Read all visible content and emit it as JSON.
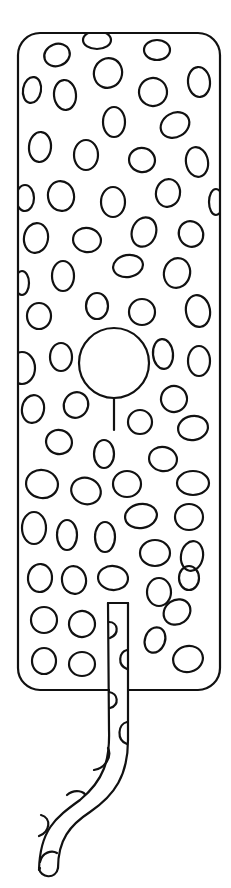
{
  "drawing": {
    "title": "Giraffe-pattern body with tail (line art)",
    "colors": {
      "ink": "#111111",
      "paper": "#ffffff"
    },
    "body": {
      "x": 18,
      "y": 33,
      "width": 202,
      "height": 657,
      "corner_radius": 22
    },
    "center_circle": {
      "cx": 114,
      "cy": 363,
      "r": 35,
      "stem": {
        "x": 114,
        "y1": 398,
        "y2": 430
      }
    },
    "spots": [
      [
        57,
        55,
        13,
        11,
        -20
      ],
      [
        97,
        40,
        14,
        9,
        0
      ],
      [
        157,
        50,
        13,
        10,
        0
      ],
      [
        32,
        90,
        9,
        13,
        10
      ],
      [
        65,
        95,
        11,
        15,
        -5
      ],
      [
        108,
        73,
        14,
        15,
        20
      ],
      [
        153,
        92,
        14,
        14,
        30
      ],
      [
        199,
        82,
        11,
        15,
        -5
      ],
      [
        40,
        147,
        11,
        15,
        5
      ],
      [
        114,
        122,
        11,
        15,
        0
      ],
      [
        175,
        125,
        15,
        12,
        -30
      ],
      [
        86,
        155,
        12,
        15,
        0
      ],
      [
        142,
        160,
        13,
        12,
        10
      ],
      [
        197,
        162,
        11,
        15,
        -10
      ],
      [
        25,
        198,
        9,
        13,
        0
      ],
      [
        61,
        196,
        13,
        15,
        -10
      ],
      [
        113,
        202,
        12,
        15,
        0
      ],
      [
        168,
        193,
        12,
        14,
        10
      ],
      [
        216,
        202,
        7,
        13,
        0
      ],
      [
        36,
        238,
        12,
        15,
        10
      ],
      [
        87,
        240,
        14,
        12,
        10
      ],
      [
        144,
        232,
        12,
        15,
        20
      ],
      [
        191,
        234,
        12,
        13,
        -30
      ],
      [
        22,
        283,
        7,
        12,
        0
      ],
      [
        63,
        276,
        11,
        15,
        0
      ],
      [
        128,
        266,
        15,
        11,
        -10
      ],
      [
        177,
        273,
        13,
        15,
        15
      ],
      [
        39,
        316,
        12,
        13,
        0
      ],
      [
        97,
        306,
        11,
        13,
        0
      ],
      [
        142,
        312,
        13,
        13,
        0
      ],
      [
        198,
        311,
        12,
        16,
        -10
      ],
      [
        22,
        368,
        13,
        16,
        0
      ],
      [
        61,
        357,
        11,
        14,
        0
      ],
      [
        163,
        354,
        10,
        15,
        -5
      ],
      [
        199,
        361,
        11,
        15,
        0
      ],
      [
        33,
        409,
        11,
        14,
        10
      ],
      [
        76,
        405,
        12,
        13,
        30
      ],
      [
        174,
        399,
        13,
        13,
        20
      ],
      [
        140,
        422,
        12,
        12,
        0
      ],
      [
        193,
        428,
        15,
        12,
        -10
      ],
      [
        59,
        442,
        13,
        12,
        15
      ],
      [
        104,
        454,
        10,
        14,
        0
      ],
      [
        163,
        459,
        14,
        12,
        10
      ],
      [
        42,
        484,
        16,
        14,
        10
      ],
      [
        86,
        491,
        15,
        13,
        20
      ],
      [
        127,
        484,
        14,
        13,
        0
      ],
      [
        193,
        483,
        16,
        12,
        0
      ],
      [
        34,
        528,
        12,
        16,
        0
      ],
      [
        67,
        535,
        10,
        15,
        0
      ],
      [
        105,
        537,
        10,
        15,
        0
      ],
      [
        141,
        516,
        16,
        12,
        -10
      ],
      [
        189,
        517,
        14,
        13,
        0
      ],
      [
        155,
        553,
        15,
        13,
        0
      ],
      [
        192,
        556,
        11,
        15,
        10
      ],
      [
        40,
        578,
        12,
        14,
        5
      ],
      [
        74,
        580,
        12,
        14,
        -10
      ],
      [
        113,
        578,
        15,
        12,
        5
      ],
      [
        159,
        592,
        12,
        14,
        0
      ],
      [
        189,
        578,
        10,
        12,
        0
      ],
      [
        44,
        620,
        13,
        13,
        0
      ],
      [
        82,
        624,
        13,
        13,
        30
      ],
      [
        177,
        612,
        14,
        12,
        -35
      ],
      [
        155,
        640,
        10,
        13,
        20
      ],
      [
        44,
        661,
        12,
        13,
        0
      ],
      [
        82,
        664,
        13,
        12,
        0
      ],
      [
        188,
        659,
        15,
        13,
        -15
      ]
    ],
    "tail": {
      "outline_left": "M108,603 L109,730 C110,760 104,780 80,800 C55,818 40,830 39,870 L40,868",
      "outline_right": "M128,603 L128,740 C128,775 115,795 90,812 C70,825 58,840 58,868",
      "top": "M108,603 L128,603",
      "bottom": "M39,868 C40,878 56,880 58,868",
      "spots": [
        "M109,622 C118,622 120,634 110,638",
        "M127,650 C119,652 117,665 127,669",
        "M109,692 C118,693 120,705 110,708",
        "M127,722 C118,724 116,740 127,744",
        "M108,748 C112,756 106,768 94,770",
        "M67,795 C75,788 85,792 85,795",
        "M41,815 C52,818 50,832 39,836",
        "M40,862 C42,852 52,850 57,853"
      ]
    }
  }
}
